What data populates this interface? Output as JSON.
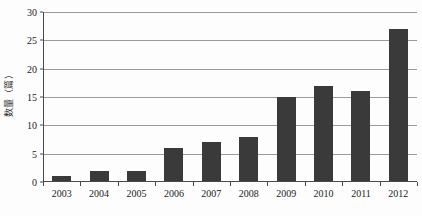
{
  "chart_data": {
    "type": "bar",
    "title": "",
    "xlabel": "",
    "ylabel": "数量（篇）",
    "categories": [
      "2003",
      "2004",
      "2005",
      "2006",
      "2007",
      "2008",
      "2009",
      "2010",
      "2011",
      "2012"
    ],
    "values": [
      1,
      2,
      2,
      6,
      7,
      8,
      15,
      17,
      16,
      27
    ],
    "series": [
      {
        "name": "数量（篇）",
        "values": [
          1,
          2,
          2,
          6,
          7,
          8,
          15,
          17,
          16,
          27
        ]
      }
    ],
    "ylim": [
      0,
      30
    ],
    "y_ticks": [
      0,
      5,
      10,
      15,
      20,
      25,
      30
    ],
    "y_tick_labels": [
      "0",
      "5",
      "10",
      "15",
      "20",
      "25",
      "30"
    ],
    "grid": true,
    "grid_axis": "y",
    "legend": false,
    "legend_position": "none",
    "bar_color": "#3a3a3a",
    "gridline_color": "#9a9a9a",
    "axis_color": "#4a4a4a",
    "background_color": "#fdfdfd"
  }
}
